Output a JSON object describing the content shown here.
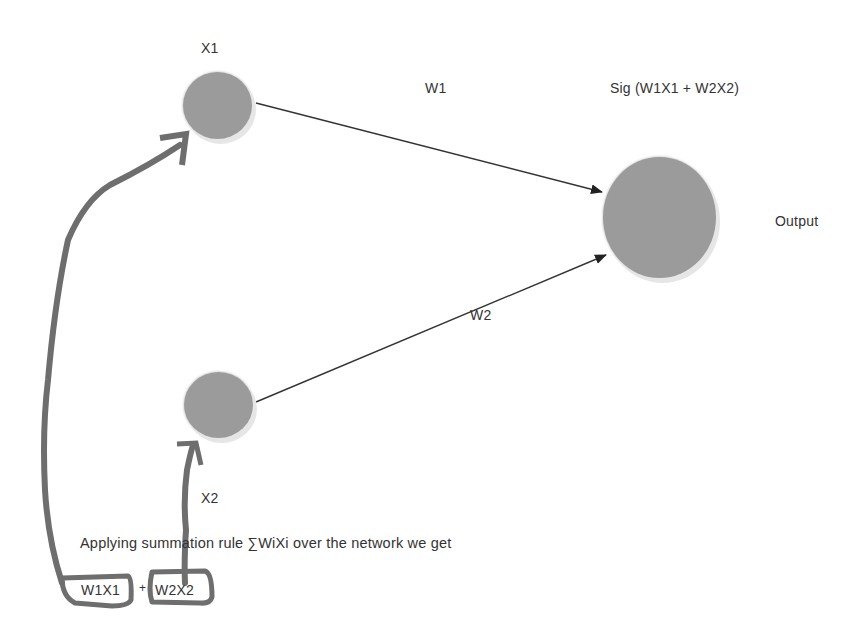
{
  "diagram": {
    "type": "neural-network-perceptron",
    "nodes": [
      {
        "id": "x1",
        "label": "X1",
        "role": "input"
      },
      {
        "id": "x2",
        "label": "X2",
        "role": "input"
      },
      {
        "id": "out",
        "label": "Output",
        "role": "output",
        "activation_label": "Sig (W1X1 + W2X2)"
      }
    ],
    "edges": [
      {
        "from": "x1",
        "to": "out",
        "label": "W1"
      },
      {
        "from": "x2",
        "to": "out",
        "label": "W2"
      }
    ],
    "annotation": {
      "text": "Applying summation rule ∑WiXi over the network we get",
      "term1": "W1X1",
      "plus": "+",
      "term2": "W2X2"
    },
    "colors": {
      "node_fill": "#9b9b9b",
      "handdrawn_stroke": "#6e6e6e",
      "edge": "#222222"
    }
  }
}
